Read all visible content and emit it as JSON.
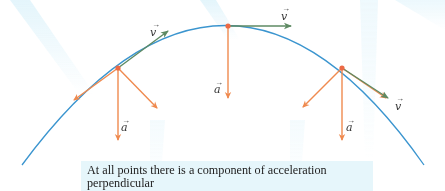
{
  "figure": {
    "colors": {
      "trajectory": "#3b95cf",
      "velocity": "#5e8a63",
      "acceleration": "#ef8a4f",
      "point": "#ec6a45",
      "caption_bg": "#e6f6fb",
      "rays": "#e3f5fb"
    },
    "points": [
      {
        "id": "left",
        "velocity_label": "v⃗",
        "acceleration_label": "a⃗"
      },
      {
        "id": "top",
        "velocity_label": "v⃗",
        "acceleration_label": "a⃗"
      },
      {
        "id": "right",
        "velocity_label": "v⃗",
        "acceleration_label": "a⃗"
      }
    ],
    "labels": {
      "v_left": "v",
      "v_top": "v",
      "v_right": "v",
      "a_left": "a",
      "a_top": "a",
      "a_right": "a"
    }
  },
  "caption": {
    "line1": "At all points there is a component of acceleration perpendicular",
    "line2": "to the trajectory: The direction of motion is changing."
  }
}
